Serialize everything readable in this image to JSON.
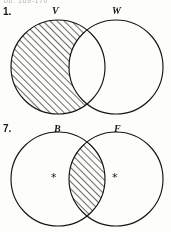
{
  "page": {
    "running_header": "pp. 169-170",
    "background_color": "#fdfdfc",
    "ink_color": "#141414",
    "width": 171,
    "height": 232
  },
  "problems": [
    {
      "number": "1.",
      "left_label": "V",
      "right_label": "W",
      "shaded_region": "left-only",
      "shaded_description": "V minus W",
      "markers": []
    },
    {
      "number": "7.",
      "left_label": "B",
      "right_label": "F",
      "shaded_region": "intersection",
      "shaded_description": "B intersect F",
      "markers": [
        {
          "symbol": "*",
          "region": "left-only"
        },
        {
          "symbol": "*",
          "region": "right-only"
        }
      ]
    }
  ]
}
